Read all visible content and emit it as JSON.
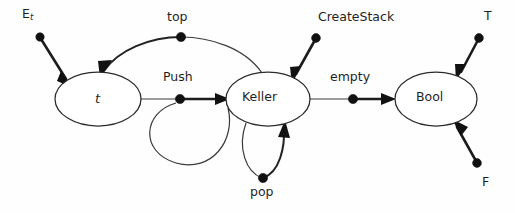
{
  "diagram": {
    "background_color": "#fefefe",
    "stroke_color": "#2b2b2b",
    "nodes": [
      {
        "id": "t",
        "label": "t",
        "cx": 98,
        "cy": 99,
        "rx": 43,
        "ry": 27,
        "italic": true
      },
      {
        "id": "keller",
        "label": "Keller",
        "cx": 268,
        "cy": 99,
        "rx": 42,
        "ry": 27,
        "italic": false
      },
      {
        "id": "bool",
        "label": "Bool",
        "cx": 436,
        "cy": 99,
        "rx": 41,
        "ry": 27,
        "italic": false
      }
    ],
    "operations": [
      {
        "id": "Et",
        "label": "E",
        "subscript": "t",
        "label_x": 22,
        "label_y": 8,
        "dot_x": 40,
        "dot_y": 37,
        "target": "t"
      },
      {
        "id": "top",
        "label": "top",
        "subscript": "",
        "label_x": 167,
        "label_y": 11,
        "dot_x": 181,
        "dot_y": 37,
        "target": "t"
      },
      {
        "id": "Push",
        "label": "Push",
        "subscript": "",
        "label_x": 163,
        "label_y": 71,
        "dot_x": 180,
        "dot_y": 99,
        "target": "keller"
      },
      {
        "id": "CreateStack",
        "label": "CreateStack",
        "subscript": "",
        "label_x": 318,
        "label_y": 11,
        "dot_x": 316,
        "dot_y": 38,
        "target": "keller"
      },
      {
        "id": "pop",
        "label": "pop",
        "subscript": "",
        "label_x": 250,
        "label_y": 186,
        "dot_x": 263,
        "dot_y": 178,
        "target": "keller"
      },
      {
        "id": "empty",
        "label": "empty",
        "subscript": "",
        "label_x": 330,
        "label_y": 71,
        "dot_x": 353,
        "dot_y": 99,
        "target": "bool"
      },
      {
        "id": "T",
        "label": "T",
        "subscript": "",
        "label_x": 484,
        "label_y": 10,
        "dot_x": 479,
        "dot_y": 38,
        "target": "bool"
      },
      {
        "id": "F",
        "label": "F",
        "subscript": "",
        "label_x": 482,
        "label_y": 176,
        "dot_x": 477,
        "dot_y": 163,
        "target": "bool"
      }
    ]
  }
}
